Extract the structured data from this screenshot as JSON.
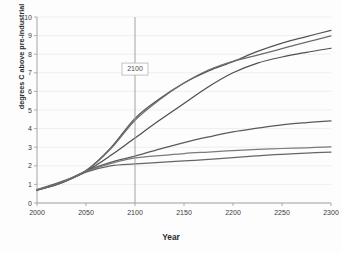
{
  "chart_data": {
    "type": "line",
    "title": "",
    "xlabel": "Year",
    "ylabel": "degrees C above pre-industrial",
    "xlim": [
      2000,
      2300
    ],
    "ylim": [
      0,
      10
    ],
    "xticks": [
      2000,
      2050,
      2100,
      2150,
      2200,
      2250,
      2300
    ],
    "yticks": [
      0,
      1,
      2,
      3,
      4,
      5,
      6,
      7,
      8,
      9,
      10
    ],
    "grid": "horizontal",
    "legend": "none",
    "annotations": [
      {
        "label": "2100",
        "x": 2100,
        "y": 7.2,
        "type": "vertical-marker-line"
      }
    ],
    "x": [
      2000,
      2025,
      2050,
      2075,
      2100,
      2125,
      2150,
      2175,
      2200,
      2225,
      2250,
      2275,
      2300
    ],
    "series": [
      {
        "name": "highest",
        "color": "#555555",
        "values": [
          0.72,
          1.15,
          1.75,
          2.95,
          4.55,
          5.6,
          6.45,
          7.1,
          7.6,
          8.15,
          8.6,
          8.95,
          9.28
        ]
      },
      {
        "name": "second-highest",
        "color": "#6b6b6b",
        "values": [
          0.7,
          1.12,
          1.72,
          2.9,
          4.45,
          5.55,
          6.45,
          7.15,
          7.62,
          7.95,
          8.3,
          8.65,
          8.98
        ]
      },
      {
        "name": "third",
        "color": "#4f4f4f",
        "values": [
          0.68,
          1.08,
          1.7,
          2.55,
          3.5,
          4.45,
          5.35,
          6.25,
          7.0,
          7.52,
          7.85,
          8.1,
          8.32
        ]
      },
      {
        "name": "mid",
        "color": "#5a5a5a",
        "values": [
          0.7,
          1.1,
          1.72,
          2.18,
          2.52,
          2.9,
          3.25,
          3.55,
          3.82,
          4.02,
          4.2,
          4.32,
          4.42
        ]
      },
      {
        "name": "low",
        "color": "#7a7a7a",
        "values": [
          0.7,
          1.1,
          1.7,
          2.12,
          2.42,
          2.55,
          2.66,
          2.74,
          2.82,
          2.88,
          2.93,
          2.97,
          3.02
        ]
      },
      {
        "name": "lowest",
        "color": "#666666",
        "values": [
          0.68,
          1.08,
          1.66,
          2.0,
          2.1,
          2.18,
          2.26,
          2.34,
          2.44,
          2.54,
          2.62,
          2.68,
          2.74
        ]
      }
    ]
  },
  "axes": {
    "y_tick_labels": [
      "10",
      "9",
      "8",
      "7",
      "6",
      "5",
      "4",
      "3",
      "2",
      "1",
      "0"
    ],
    "x_tick_labels": [
      "2000",
      "2050",
      "2100",
      "2150",
      "2200",
      "2250",
      "2300"
    ],
    "x_title": "Year",
    "y_title": "degrees C above pre-industrial"
  },
  "marker": {
    "label": "2100"
  },
  "style": {
    "background": "#fdfdfd",
    "grid_color": "#e9e9e9",
    "axis_color": "#9a9a9a",
    "text_color": "#2b2b2b"
  }
}
